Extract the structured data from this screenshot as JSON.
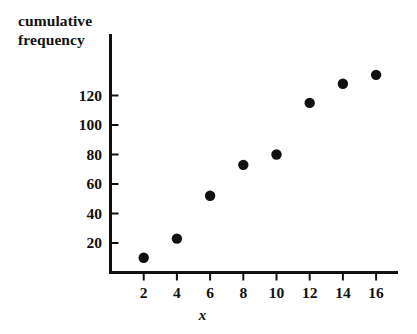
{
  "chart_data": {
    "type": "scatter",
    "title": "",
    "ylabel": "cumulative frequency",
    "ylabel_lines": [
      "cumulative",
      "frequency"
    ],
    "xlabel": "x",
    "x": [
      2,
      4,
      6,
      8,
      10,
      12,
      14,
      16
    ],
    "values": [
      10,
      23,
      52,
      73,
      80,
      115,
      128,
      134
    ],
    "series": [
      {
        "name": "cumulative frequency",
        "x": [
          2,
          4,
          6,
          8,
          10,
          12,
          14,
          16
        ],
        "values": [
          10,
          23,
          52,
          73,
          80,
          115,
          128,
          134
        ]
      }
    ],
    "xticks": [
      "2",
      "4",
      "6",
      "8",
      "10",
      "12",
      "14",
      "16"
    ],
    "xtick_values": [
      2,
      4,
      6,
      8,
      10,
      12,
      14,
      16
    ],
    "yticks": [
      "20",
      "40",
      "60",
      "80",
      "100",
      "120"
    ],
    "ytick_values": [
      20,
      40,
      60,
      80,
      100,
      120
    ],
    "xlim": [
      0,
      17.6
    ],
    "ylim": [
      0,
      147
    ],
    "grid": false,
    "legend": false,
    "legend_position": "none",
    "marker": "filled-circle",
    "marker_color": "#111111",
    "axis_color": "#111111",
    "background_color": "#ffffff"
  },
  "axes": {
    "y_title_line_1": "cumulative",
    "y_title_line_2": "frequency",
    "x_title": "x"
  }
}
